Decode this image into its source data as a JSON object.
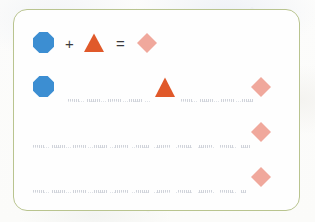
{
  "worksheet": {
    "card": {
      "border_color": "#b9c48f",
      "background_color": "#fefefe"
    },
    "page_background_color": "#fbfbfa",
    "palette": {
      "blue": "#3c8ed2",
      "orange": "#e0592a",
      "pink": "#f0a89c",
      "rule": "#c9ccd4",
      "operator": "#3b3b3d"
    },
    "example_row": {
      "label": "example-equation",
      "items": [
        {
          "kind": "shape",
          "shape": "octagon",
          "color": "#3c8ed2",
          "name": "blue-octagon"
        },
        {
          "kind": "operator",
          "glyph": "+",
          "name": "plus-operator"
        },
        {
          "kind": "shape",
          "shape": "triangle",
          "color": "#e0592a",
          "name": "orange-triangle"
        },
        {
          "kind": "operator",
          "glyph": "=",
          "name": "equals-operator"
        },
        {
          "kind": "shape",
          "shape": "diamond",
          "color": "#f0a89c",
          "name": "pink-diamond"
        }
      ]
    },
    "practice_rows": [
      {
        "label": "practice-row-1",
        "given_left": {
          "shape": "octagon",
          "color": "#3c8ed2",
          "name": "blue-octagon"
        },
        "blank_1": "",
        "given_middle": {
          "shape": "triangle",
          "color": "#e0592a",
          "name": "orange-triangle"
        },
        "blank_2": "",
        "given_right": {
          "shape": "diamond",
          "color": "#f0a89c",
          "name": "pink-diamond"
        }
      },
      {
        "label": "practice-row-2",
        "blank_1": "",
        "given_right": {
          "shape": "diamond",
          "color": "#f0a89c",
          "name": "pink-diamond"
        }
      },
      {
        "label": "practice-row-3",
        "blank_1": "",
        "given_right": {
          "shape": "diamond",
          "color": "#f0a89c",
          "name": "pink-diamond"
        }
      }
    ]
  }
}
